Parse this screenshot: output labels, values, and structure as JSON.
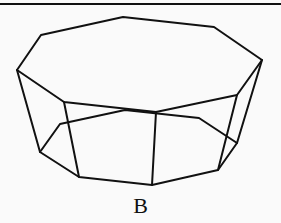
{
  "figure": {
    "label": "B",
    "stroke_color": "#111111",
    "background_color": "#fafafa",
    "top_border": {
      "y": 4
    },
    "top_face": [
      [
        41,
        35
      ],
      [
        123,
        17
      ],
      [
        214,
        27
      ],
      [
        262,
        60
      ],
      [
        237,
        95
      ],
      [
        156,
        112
      ],
      [
        64,
        102
      ],
      [
        17,
        70
      ]
    ],
    "bottom_face": [
      [
        40,
        152
      ],
      [
        60,
        124
      ],
      [
        125,
        110
      ],
      [
        199,
        118
      ],
      [
        237,
        143
      ],
      [
        218,
        170
      ],
      [
        152,
        185
      ],
      [
        79,
        177
      ]
    ],
    "lateral_edges": [
      [
        [
          17,
          70
        ],
        [
          40,
          152
        ]
      ],
      [
        [
          64,
          102
        ],
        [
          79,
          177
        ]
      ],
      [
        [
          156,
          112
        ],
        [
          152,
          185
        ]
      ],
      [
        [
          237,
          95
        ],
        [
          218,
          170
        ]
      ],
      [
        [
          262,
          60
        ],
        [
          237,
          143
        ]
      ]
    ]
  }
}
